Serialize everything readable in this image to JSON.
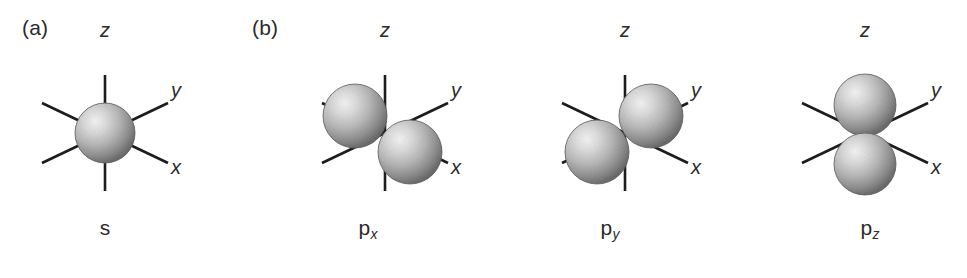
{
  "figure": {
    "background_color": "#ffffff",
    "axis_line_color": "#1c1c1c",
    "sphere_light_color": "#f2f2f2",
    "sphere_mid_color": "#b4b4b4",
    "sphere_dark_color": "#6e6e6e",
    "sphere_edge_color": "#5a5a5a"
  },
  "panels": [
    {
      "tag": "(a)",
      "tag_x": 22,
      "tag_y": 16,
      "name_html": "s",
      "name_base": "s",
      "name_sub": "",
      "name_x": 105,
      "name_y": 216,
      "origin_x": 105,
      "origin_y": 133,
      "axes": {
        "z": {
          "label": "z",
          "label_x": 105,
          "label_y": 30
        },
        "y": {
          "label": "y",
          "label_x": 176,
          "label_y": 90
        },
        "x": {
          "label": "x",
          "label_y": 167,
          "label_x": 176
        }
      },
      "lobes": [
        {
          "cx": 105,
          "cy": 133,
          "rx": 30,
          "ry": 30,
          "depth": "front"
        }
      ]
    },
    {
      "tag": "(b)",
      "tag_x": 252,
      "tag_y": 16,
      "name_html": "p",
      "name_base": "p",
      "name_sub": "x",
      "name_x": 368,
      "name_y": 216,
      "origin_x": 385,
      "origin_y": 133,
      "axes": {
        "z": {
          "label": "z",
          "label_x": 385,
          "label_y": 30
        },
        "y": {
          "label": "y",
          "label_x": 456,
          "label_y": 90
        },
        "x": {
          "label": "x",
          "label_y": 167,
          "label_x": 456
        }
      },
      "lobes": [
        {
          "cx": 355,
          "cy": 116,
          "rx": 32,
          "ry": 32,
          "depth": "front"
        },
        {
          "cx": 410,
          "cy": 152,
          "rx": 32,
          "ry": 32,
          "depth": "front"
        }
      ]
    },
    {
      "tag": "",
      "tag_x": 0,
      "tag_y": 0,
      "name_html": "p",
      "name_base": "p",
      "name_sub": "y",
      "name_x": 610,
      "name_y": 216,
      "origin_x": 625,
      "origin_y": 133,
      "axes": {
        "z": {
          "label": "z",
          "label_x": 625,
          "label_y": 30
        },
        "y": {
          "label": "y",
          "label_x": 696,
          "label_y": 90
        },
        "x": {
          "label": "x",
          "label_y": 167,
          "label_x": 696
        }
      },
      "lobes": [
        {
          "cx": 597,
          "cy": 152,
          "rx": 32,
          "ry": 32,
          "depth": "front"
        },
        {
          "cx": 651,
          "cy": 116,
          "rx": 32,
          "ry": 32,
          "depth": "front"
        }
      ]
    },
    {
      "tag": "",
      "tag_x": 0,
      "tag_y": 0,
      "name_html": "p",
      "name_base": "p",
      "name_sub": "z",
      "name_x": 870,
      "name_y": 216,
      "origin_x": 865,
      "origin_y": 133,
      "axes": {
        "z": {
          "label": "z",
          "label_x": 865,
          "label_y": 30
        },
        "y": {
          "label": "y",
          "label_x": 936,
          "label_y": 90
        },
        "x": {
          "label": "x",
          "label_y": 167,
          "label_x": 936
        }
      },
      "lobes": [
        {
          "cx": 865,
          "cy": 105,
          "rx": 31,
          "ry": 31,
          "depth": "front"
        },
        {
          "cx": 865,
          "cy": 164,
          "rx": 31,
          "ry": 31,
          "depth": "front"
        }
      ]
    }
  ],
  "axis_geometry": {
    "z_half_length": 58,
    "diag_dx": 63,
    "diag_dy_y_axis": -30,
    "diag_dy_x_axis": 30,
    "line_width": 2.6
  }
}
